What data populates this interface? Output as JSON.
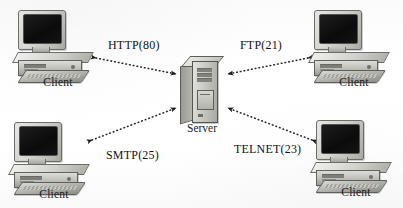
{
  "diagram": {
    "background_color": "#fdfdfd",
    "line_color": "#2a2a2a",
    "text_color": "#131313"
  },
  "server": {
    "label": "Server",
    "icon": "tower-computer-icon"
  },
  "clients": [
    {
      "id": "client-top-left",
      "label": "Client",
      "icon": "desktop-computer-icon"
    },
    {
      "id": "client-top-right",
      "label": "Client",
      "icon": "desktop-computer-icon"
    },
    {
      "id": "client-bottom-left",
      "label": "Client",
      "icon": "desktop-computer-icon"
    },
    {
      "id": "client-bottom-right",
      "label": "Client",
      "icon": "desktop-computer-icon"
    }
  ],
  "connections": [
    {
      "id": "conn-http",
      "label": "HTTP(80)",
      "protocol": "HTTP",
      "port": "80",
      "from": "client-top-left",
      "to": "server",
      "style": "dotted-double-arrow"
    },
    {
      "id": "conn-ftp",
      "label": "FTP(21)",
      "protocol": "FTP",
      "port": "21",
      "from": "client-top-right",
      "to": "server",
      "style": "dotted-double-arrow"
    },
    {
      "id": "conn-smtp",
      "label": "SMTP(25)",
      "protocol": "SMTP",
      "port": "25",
      "from": "client-bottom-left",
      "to": "server",
      "style": "dotted-double-arrow"
    },
    {
      "id": "conn-telnet",
      "label": "TELNET(23)",
      "protocol": "TELNET",
      "port": "23",
      "from": "client-bottom-right",
      "to": "server",
      "style": "dotted-double-arrow"
    }
  ]
}
